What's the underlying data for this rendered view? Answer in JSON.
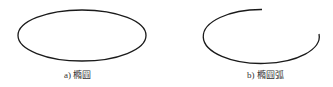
{
  "figures": [
    {
      "id": "a",
      "caption": "a) 橢圓",
      "shape": "ellipse",
      "stroke_color": "#1a1a1a"
    },
    {
      "id": "b",
      "caption": "b) 橢圓弧",
      "shape": "elliptical-arc",
      "stroke_color": "#1a1a1a"
    }
  ]
}
